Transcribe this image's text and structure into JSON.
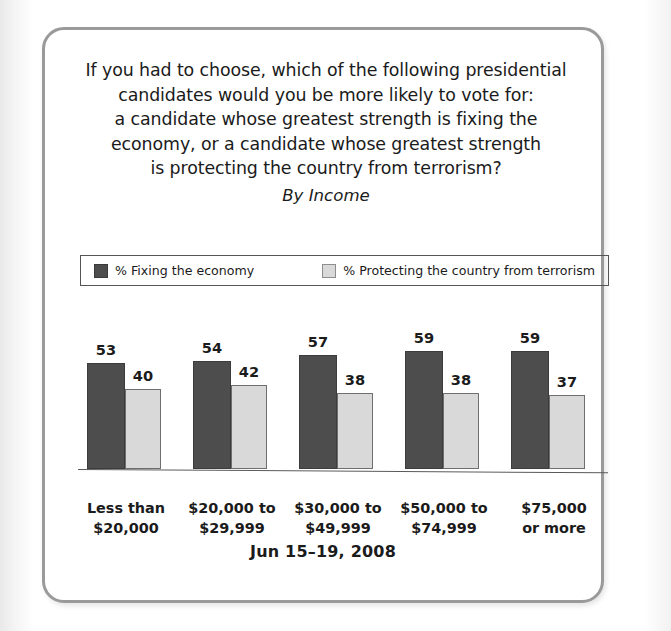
{
  "card": {
    "title_lines": [
      "If you had to choose, which of the following presidential",
      "candidates would you be more likely to vote for:",
      "a candidate whose greatest strength is fixing the",
      "economy, or a candidate whose greatest strength",
      "is protecting the country from terrorism?"
    ],
    "subtitle": "By Income",
    "footer_date": "Jun 15–19, 2008"
  },
  "legend": {
    "items": [
      {
        "label": "% Fixing the economy",
        "swatch": "dark",
        "color": "#4d4d4d"
      },
      {
        "label": "% Protecting the country from terrorism",
        "swatch": "light",
        "color": "#d9d9d9"
      }
    ]
  },
  "chart_data": {
    "type": "bar",
    "subtitle": "By Income",
    "xlabel": "",
    "ylabel": "",
    "ylim": [
      0,
      70
    ],
    "grid": false,
    "legend_position": "top",
    "annotation": "Jun 15–19, 2008",
    "categories": [
      [
        "Less than",
        "$20,000"
      ],
      [
        "$20,000 to",
        "$29,999"
      ],
      [
        "$30,000 to",
        "$49,999"
      ],
      [
        "$50,000 to",
        "$74,999"
      ],
      [
        "$75,000",
        "or more"
      ]
    ],
    "category_labels": [
      "Less than $20,000",
      "$20,000 to $29,999",
      "$30,000 to $49,999",
      "$50,000 to $74,999",
      "$75,000 or more"
    ],
    "series": [
      {
        "name": "% Fixing the economy",
        "color": "#4d4d4d",
        "values": [
          53,
          54,
          57,
          59,
          59
        ]
      },
      {
        "name": "% Protecting the country from terrorism",
        "color": "#d9d9d9",
        "values": [
          40,
          42,
          38,
          38,
          37
        ]
      }
    ]
  }
}
